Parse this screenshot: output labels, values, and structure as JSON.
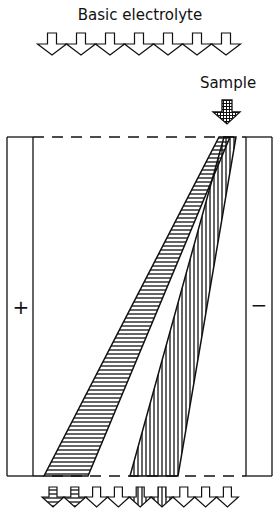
{
  "labels": {
    "top": "Basic electrolyte",
    "sample": "Sample",
    "anode": "+",
    "cathode": "−"
  },
  "inlet_arrows": {
    "count": 7,
    "fill": "empty"
  },
  "sample_arrow": {
    "fill": "crosshatch"
  },
  "streams": [
    {
      "name": "horizontal-hatched-band",
      "pattern": "horizontal",
      "deflection": "toward +"
    },
    {
      "name": "vertical-hatched-band",
      "pattern": "vertical",
      "deflection": "toward +"
    }
  ],
  "outlet_arrows": {
    "count": 9,
    "fills": [
      "horizontal",
      "horizontal",
      "empty",
      "empty",
      "vertical",
      "vertical",
      "empty",
      "empty",
      "empty"
    ]
  },
  "colors": {
    "ink": "#111111",
    "background": "#ffffff"
  }
}
